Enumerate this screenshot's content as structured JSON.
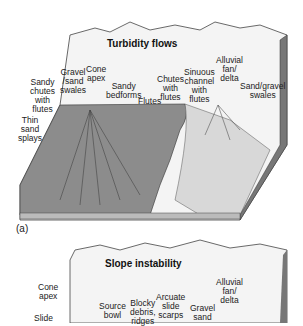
{
  "panel_a": {
    "title": "Turbidity flows",
    "caption": "(a)",
    "labels": {
      "sandy_chutes": "Sandy\nchutes\nwith\nflutes",
      "thin_sand_splays": "Thin\nsand\nsplays",
      "gravel_sand_swales": "Gravel\n/sand\nswales",
      "cone_apex": "Cone\napex",
      "sandy_bedforms": "Sandy\nbedforms",
      "flutes": "Flutes",
      "chutes_with_flutes": "Chutes\nwith\nflutes",
      "sinuous_channel": "Sinuous\nchannel\nwith\nflutes",
      "alluvial_fan": "Alluvial\nfan/\ndelta",
      "sand_gravel_swales": "Sand/gravel\nswales"
    }
  },
  "panel_b": {
    "title": "Slope instability",
    "labels": {
      "cone_apex": "Cone\napex",
      "slide": "Slide",
      "source_bowl": "Source\nbowl",
      "blocky_debris": "Blocky\ndebris,\nridges",
      "arcuate_scarps": "Arcuate\nslide\nscarps",
      "gravel_sand": "Gravel\nsand",
      "alluvial_fan": "Alluvial\nfan/\ndelta"
    }
  }
}
